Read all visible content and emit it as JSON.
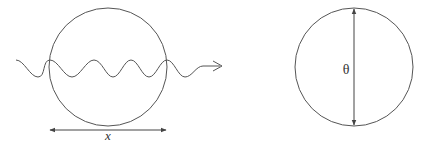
{
  "diagram": {
    "left_figure": {
      "description": "wave passing through circle",
      "width_label": "x"
    },
    "right_figure": {
      "description": "circle with vertical diameter",
      "angle_label": "θ"
    },
    "colors": {
      "stroke": "#555555",
      "background": "#ffffff"
    }
  }
}
